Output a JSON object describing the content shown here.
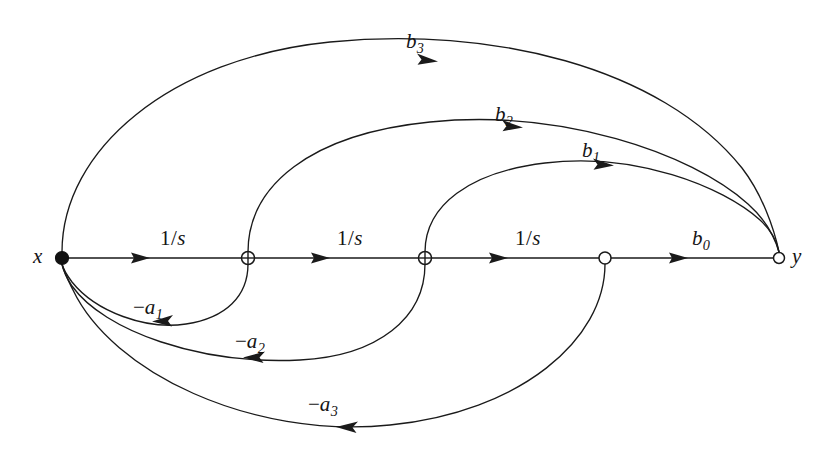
{
  "figure": {
    "type": "signal-flow-graph",
    "background_color": "#ffffff",
    "ink_color": "#1a1a1a"
  },
  "nodes": [
    {
      "id": "x",
      "label": "x",
      "x": 62,
      "y": 258,
      "style": "filled-dot",
      "radius": 6.5
    },
    {
      "id": "n1",
      "label": "",
      "x": 248,
      "y": 258,
      "style": "open-circle-cross",
      "radius": 6.5
    },
    {
      "id": "n2",
      "label": "",
      "x": 425,
      "y": 258,
      "style": "open-circle-cross",
      "radius": 6.5
    },
    {
      "id": "n3",
      "label": "",
      "x": 605,
      "y": 258,
      "style": "open-circle",
      "radius": 6.0
    },
    {
      "id": "y",
      "label": "y",
      "x": 779,
      "y": 258,
      "style": "open-circle",
      "radius": 5.5
    }
  ],
  "forward_path": {
    "labels": [
      {
        "text": "1/s",
        "numerator": "1",
        "slash": "/",
        "denominator": "s",
        "x": 160,
        "y": 228
      },
      {
        "text": "1/s",
        "numerator": "1",
        "slash": "/",
        "denominator": "s",
        "x": 337,
        "y": 228
      },
      {
        "text": "1/s",
        "numerator": "1",
        "slash": "/",
        "denominator": "s",
        "x": 515,
        "y": 228
      },
      {
        "text": "b0",
        "base": "b",
        "subscript": "0",
        "x": 692,
        "y": 228
      }
    ]
  },
  "feedforward_edges": [
    {
      "id": "b1",
      "base": "b",
      "subscript": "1",
      "from": "n2",
      "to": "y",
      "label_x": 582,
      "label_y": 140
    },
    {
      "id": "b2",
      "base": "b",
      "subscript": "2",
      "from": "n1",
      "to": "y",
      "label_x": 495,
      "label_y": 104
    },
    {
      "id": "b3",
      "base": "b",
      "subscript": "3",
      "from": "x",
      "to": "y",
      "label_x": 406,
      "label_y": 31
    }
  ],
  "feedback_edges": [
    {
      "id": "-a1",
      "sign": "−",
      "base": "a",
      "subscript": "1",
      "from": "n1",
      "to": "x",
      "label_x": 133,
      "label_y": 297
    },
    {
      "id": "-a2",
      "sign": "−",
      "base": "a",
      "subscript": "2",
      "from": "n2",
      "to": "x",
      "label_x": 235,
      "label_y": 331
    },
    {
      "id": "-a3",
      "sign": "−",
      "base": "a",
      "subscript": "3",
      "from": "n3",
      "to": "x",
      "label_x": 308,
      "label_y": 394
    }
  ],
  "node_labels": [
    {
      "id": "x-label",
      "text": "x",
      "x": 33,
      "y": 246
    },
    {
      "id": "y-label",
      "text": "y",
      "x": 792,
      "y": 246
    }
  ]
}
